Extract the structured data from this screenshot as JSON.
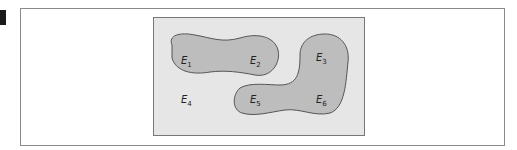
{
  "diagram": {
    "type": "venn-like outcome regions",
    "sample_space_label": "",
    "regions": [
      {
        "id": "A",
        "contains": [
          "E1",
          "E2"
        ]
      },
      {
        "id": "B",
        "contains": [
          "E3",
          "E5",
          "E6"
        ]
      }
    ],
    "outcomes": [
      {
        "name": "E",
        "sub": "1"
      },
      {
        "name": "E",
        "sub": "2"
      },
      {
        "name": "E",
        "sub": "3"
      },
      {
        "name": "E",
        "sub": "4"
      },
      {
        "name": "E",
        "sub": "5"
      },
      {
        "name": "E",
        "sub": "6"
      }
    ]
  },
  "colors": {
    "frame_border": "#8a8a8a",
    "sample_space_fill": "#e6e6e6",
    "sample_space_border": "#777777",
    "region_fill": "#bdbdbd",
    "region_stroke": "#555555",
    "marker": "#1a1a1a"
  }
}
